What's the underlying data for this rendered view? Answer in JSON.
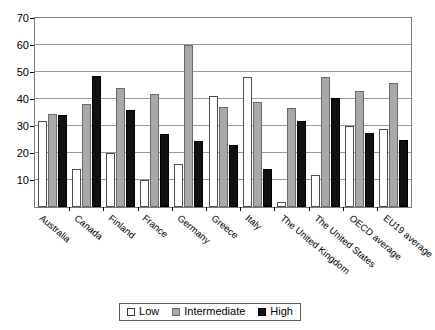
{
  "chart_data": {
    "type": "bar",
    "title": "",
    "subtitle": "",
    "xlabel": "",
    "ylabel": "",
    "ylim": [
      0,
      70
    ],
    "yticks": [
      10,
      20,
      30,
      40,
      50,
      60,
      70
    ],
    "grid": true,
    "legend_position": "bottom",
    "categories": [
      "Australia",
      "Canada",
      "Finland",
      "France",
      "Germany",
      "Greece",
      "Italy",
      "The United Kingdom",
      "The United States",
      "OECD average",
      "EU19 average"
    ],
    "series": [
      {
        "name": "Low",
        "color": "#ffffff",
        "values": [
          32,
          14,
          20,
          10,
          16,
          41,
          48,
          2,
          12,
          30,
          29
        ]
      },
      {
        "name": "Intermediate",
        "color": "#a8a8a8",
        "values": [
          34.5,
          38,
          44,
          42,
          60,
          37,
          39,
          36.5,
          48,
          43,
          46
        ]
      },
      {
        "name": "High",
        "color": "#111111",
        "values": [
          34,
          48.5,
          36,
          27,
          24.5,
          23,
          14,
          32,
          40.5,
          27.5,
          25
        ]
      }
    ]
  },
  "legend": {
    "items": [
      {
        "label": "Low",
        "key": "low"
      },
      {
        "label": "Intermediate",
        "key": "intermediate"
      },
      {
        "label": "High",
        "key": "high"
      }
    ]
  }
}
